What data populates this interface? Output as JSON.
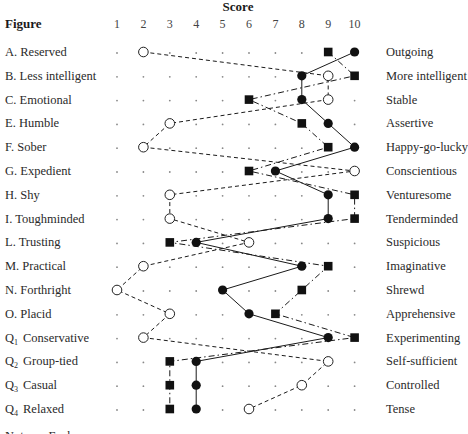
{
  "chart_data": {
    "type": "line",
    "title": "Score",
    "header_left": "Figure",
    "xlabel": "Score",
    "x_ticks": [
      1,
      2,
      3,
      4,
      5,
      6,
      7,
      8,
      9,
      10
    ],
    "xlim": [
      1,
      10
    ],
    "grid": "dotted points at each score position",
    "rows": [
      {
        "label": "A. Reserved",
        "sub": "",
        "right": "Outgoing"
      },
      {
        "label": "B. Less intelligent",
        "sub": "",
        "right": "More intelligent"
      },
      {
        "label": "C. Emotional",
        "sub": "",
        "right": "Stable"
      },
      {
        "label": "E. Humble",
        "sub": "",
        "right": "Assertive"
      },
      {
        "label": "F. Sober",
        "sub": "",
        "right": "Happy-go-lucky"
      },
      {
        "label": "G. Expedient",
        "sub": "",
        "right": "Conscientious"
      },
      {
        "label": "H. Shy",
        "sub": "",
        "right": "Venturesome"
      },
      {
        "label": "I. Toughminded",
        "sub": "",
        "right": "Tenderminded"
      },
      {
        "label": "L. Trusting",
        "sub": "",
        "right": "Suspicious"
      },
      {
        "label": "M. Practical",
        "sub": "",
        "right": "Imaginative"
      },
      {
        "label": "N. Forthright",
        "sub": "",
        "right": "Shrewd"
      },
      {
        "label": "O. Placid",
        "sub": "",
        "right": "Apprehensive"
      },
      {
        "label": "Q",
        "sub": "1",
        "tail": "Conservative",
        "right": "Experimenting"
      },
      {
        "label": "Q",
        "sub": "2",
        "tail": "Group-tied",
        "right": "Self-sufficient"
      },
      {
        "label": "Q",
        "sub": "3",
        "tail": "Casual",
        "right": "Controlled"
      },
      {
        "label": "Q",
        "sub": "4",
        "tail": "Relaxed",
        "right": "Tense"
      }
    ],
    "series": [
      {
        "name": "filled-circle",
        "marker": "filled-circle",
        "line": "solid",
        "values": [
          10,
          8,
          8,
          9,
          10,
          7,
          9,
          9,
          4,
          8,
          5,
          6,
          9,
          4,
          4,
          4
        ]
      },
      {
        "name": "square",
        "marker": "filled-square",
        "line": "dash-dot",
        "values": [
          9,
          10,
          6,
          8,
          9,
          6,
          10,
          10,
          3,
          9,
          8,
          7,
          10,
          3,
          3,
          3
        ]
      },
      {
        "name": "open-circle",
        "marker": "open-circle",
        "line": "dashed",
        "values": [
          2,
          9,
          9,
          3,
          2,
          10,
          3,
          3,
          6,
          2,
          1,
          3,
          2,
          9,
          8,
          6
        ]
      }
    ],
    "footer_partial": "Note: ... Each ..."
  }
}
